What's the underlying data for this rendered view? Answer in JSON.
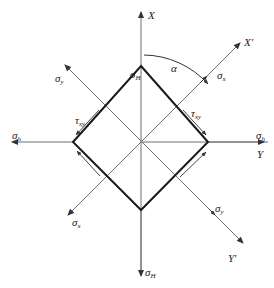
{
  "diagram": {
    "type": "stress-element-rotation",
    "colors": {
      "axis": "#6e6e6e",
      "element": "#1a1a1a",
      "text": "#222222",
      "background": "#ffffff"
    },
    "axes": {
      "X": "X",
      "Y": "Y",
      "X_prime": "X'",
      "Y_prime": "Y'"
    },
    "angle_label": "α",
    "stresses": {
      "sigma_H_top": {
        "symbol": "σ",
        "sub": "H"
      },
      "sigma_H_bottom": {
        "symbol": "σ",
        "sub": "H"
      },
      "sigma_h_left": {
        "symbol": "σ",
        "sub": "h"
      },
      "sigma_h_right": {
        "symbol": "σ",
        "sub": "h"
      },
      "sigma_x_upper": {
        "symbol": "σ",
        "sub": "x"
      },
      "sigma_x_lower": {
        "symbol": "σ",
        "sub": "x"
      },
      "sigma_y_upper": {
        "symbol": "σ",
        "sub": "y"
      },
      "sigma_y_lower": {
        "symbol": "σ",
        "sub": "y"
      },
      "tau_left": {
        "symbol": "τ",
        "sub": "xy"
      },
      "tau_right": {
        "symbol": "τ",
        "sub": "xy"
      }
    }
  }
}
